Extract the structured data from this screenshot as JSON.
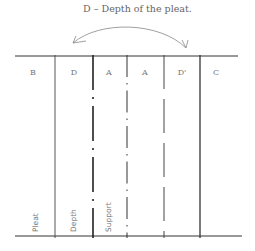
{
  "caption": "D – Depth of the pleat.",
  "columns": [
    {
      "label": "B"
    },
    {
      "label": "D"
    },
    {
      "label": "A"
    },
    {
      "label": "A"
    },
    {
      "label": "D'"
    },
    {
      "label": "C"
    }
  ],
  "vertical_labels": {
    "pleat": "Pleat",
    "depth": "Depth",
    "support": "Support"
  },
  "colors": {
    "line": "#333333",
    "text": "#777777",
    "arrow": "#888888"
  }
}
